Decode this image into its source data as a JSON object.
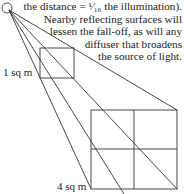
{
  "caption": {
    "lines": [
      "the distance = ¹⁄₁₆ the illumination).",
      "Nearby reflecting surfaces will",
      "lessen the fall-off, as will any",
      "diffuser that  broadens",
      "the source of light."
    ]
  },
  "labels": {
    "small_square": "1 sq m",
    "large_square": "4 sq m"
  },
  "colors": {
    "line": "#333333",
    "text": "#222222",
    "background": "#ffffff"
  }
}
